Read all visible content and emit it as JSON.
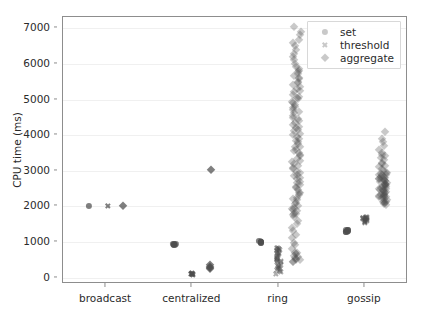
{
  "figure": {
    "width": 421,
    "height": 316,
    "background": "#ffffff",
    "axes_rect": {
      "left": 62,
      "top": 16,
      "width": 345,
      "height": 267
    },
    "marker_color": "#4d4d4d",
    "grid_color": "#f0f0f0",
    "spine_color": "#8d8d8d"
  },
  "chart_data": {
    "type": "scatter",
    "title": "",
    "xlabel": "",
    "ylabel": "CPU time (ms)",
    "categories": [
      "broadcast",
      "centralized",
      "ring",
      "gossip"
    ],
    "ylim": [
      -180,
      7320
    ],
    "yticks": [
      0,
      1000,
      2000,
      3000,
      4000,
      5000,
      6000,
      7000
    ],
    "ytick_labels": [
      "0",
      "1000",
      "2000",
      "3000",
      "4000",
      "5000",
      "6000",
      "7000"
    ],
    "grid": true,
    "grid_axis": "y",
    "legend": {
      "position": "upper right",
      "entries": [
        {
          "label": "set",
          "marker": "circle"
        },
        {
          "label": "threshold",
          "marker": "x"
        },
        {
          "label": "aggregate",
          "marker": "diamond"
        }
      ]
    },
    "series": [
      {
        "name": "set",
        "marker": "circle",
        "points": [
          {
            "category": "broadcast",
            "values": [
              2020
            ]
          },
          {
            "category": "centralized",
            "values": [
              930,
              935,
              925,
              940,
              920
            ]
          },
          {
            "category": "ring",
            "values": [
              1000,
              1005,
              995,
              1010,
              990
            ]
          },
          {
            "category": "gossip",
            "values": [
              1320,
              1330,
              1310,
              1340,
              1300,
              1325
            ]
          }
        ]
      },
      {
        "name": "threshold",
        "marker": "x",
        "points": [
          {
            "category": "broadcast",
            "values": [
              2020
            ]
          },
          {
            "category": "centralized",
            "values": [
              100,
              110,
              90,
              120,
              80,
              105
            ]
          },
          {
            "category": "ring",
            "values": [
              140,
              200,
              260,
              320,
              380,
              430,
              470,
              510,
              560,
              600,
              650,
              700,
              750,
              800,
              830,
              850,
              120,
              180,
              240,
              300,
              360,
              420,
              480,
              540,
              590,
              640,
              690,
              740,
              790,
              820
            ]
          },
          {
            "category": "gossip",
            "values": [
              1560,
              1580,
              1600,
              1620,
              1640,
              1660,
              1680,
              1700,
              1540,
              1590,
              1610,
              1630,
              1650,
              1670,
              1690,
              1710
            ]
          }
        ]
      },
      {
        "name": "aggregate",
        "marker": "diamond",
        "points": [
          {
            "category": "broadcast",
            "values": [
              2020
            ]
          },
          {
            "category": "centralized",
            "values": [
              3010,
              280,
              300,
              260,
              320
            ]
          },
          {
            "category": "ring",
            "values": [
              7050,
              6900,
              6800,
              6700,
              6600,
              6500,
              6400,
              6300,
              6200,
              6100,
              6000,
              5900,
              5800,
              5700,
              5600,
              5500,
              5400,
              5300,
              5200,
              5100,
              5000,
              4900,
              4800,
              4700,
              4600,
              4500,
              4400,
              4300,
              4200,
              4100,
              4000,
              3900,
              3800,
              3700,
              3600,
              3500,
              3400,
              3300,
              3200,
              3100,
              3000,
              2900,
              2800,
              2700,
              2600,
              2500,
              2400,
              2300,
              2200,
              2100,
              2000,
              1900,
              1800,
              1700,
              1600,
              1500,
              1400,
              1300,
              1200,
              1100,
              1000,
              900,
              800,
              700,
              600,
              500,
              450,
              430,
              480,
              520,
              550,
              600,
              650,
              700,
              1750,
              1800,
              1850,
              1900,
              1950,
              2050,
              2150,
              2250,
              2350,
              2450,
              2550,
              2650,
              2750,
              2850,
              2950,
              3050,
              3150,
              3250,
              3350,
              3450,
              3550,
              3650,
              3750,
              3850,
              3950,
              4050,
              4150,
              4250,
              4350,
              4450,
              4550,
              4650,
              4750,
              4850,
              4950,
              5050,
              5150,
              5250,
              5350,
              5450,
              5550,
              5650,
              5750,
              5850
            ]
          },
          {
            "category": "gossip",
            "values": [
              4080,
              3900,
              3800,
              3700,
              3600,
              3500,
              3450,
              3400,
              3350,
              3300,
              3250,
              3200,
              3150,
              3100,
              3050,
              3000,
              2950,
              2900,
              2850,
              2800,
              2750,
              2700,
              2650,
              2600,
              2550,
              2500,
              2450,
              2400,
              2350,
              2300,
              2250,
              2200,
              2150,
              2100,
              2080,
              2060,
              2950,
              2880,
              2820,
              2760,
              2700,
              2640,
              2580,
              2520,
              2460,
              2400,
              2340,
              2280,
              2220,
              2180,
              2140,
              2120,
              2900,
              2850,
              2800,
              2750,
              2700,
              2650,
              2600,
              2550,
              2500,
              2450,
              2400,
              2350,
              2300,
              2250
            ]
          }
        ]
      }
    ]
  }
}
